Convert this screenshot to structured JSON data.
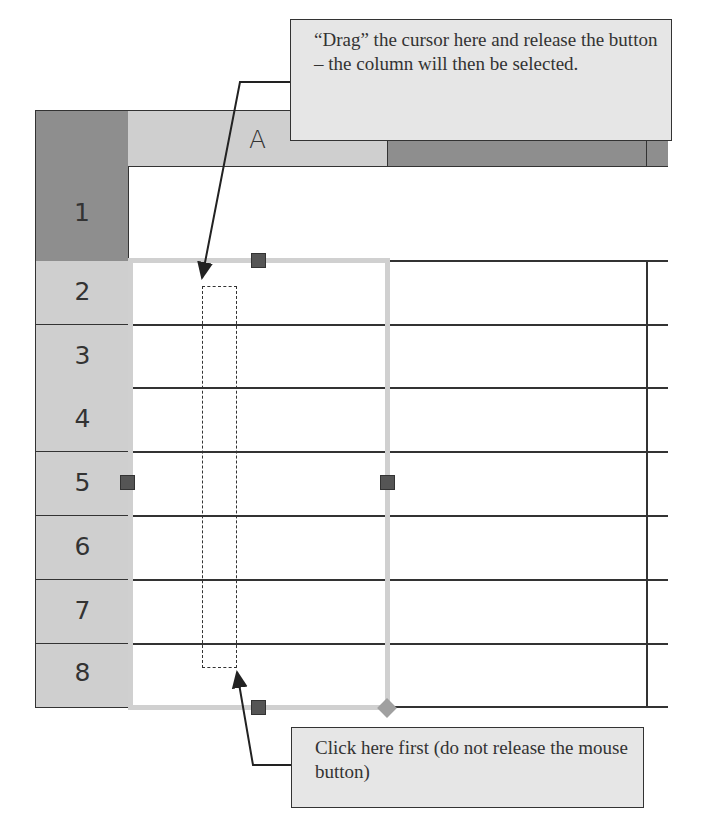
{
  "spreadsheet": {
    "column_headers": [
      "A",
      "B"
    ],
    "row_headers": [
      "1",
      "2",
      "3",
      "4",
      "5",
      "6",
      "7",
      "8"
    ],
    "selected_column": "A",
    "colors": {
      "header_dark": "#8e8e8e",
      "header_light": "#cfcfcf",
      "selection_border": "#d0d0d0",
      "handle": "#555555",
      "grid_line": "#333333"
    }
  },
  "callouts": {
    "drag": {
      "text": "“Drag” the cursor here and release the button – the column will then be selected."
    },
    "click": {
      "text": "Click here first (do not release the mouse button)"
    }
  }
}
